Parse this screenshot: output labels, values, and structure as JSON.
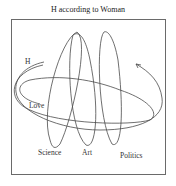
{
  "diagram": {
    "title": "H according to Woman",
    "labels": {
      "h": "H",
      "love": "Love",
      "science": "Science",
      "art": "Art",
      "politics": "Politics"
    },
    "colors": {
      "stroke": "#4a4a4a",
      "frame": "#6a6a6a",
      "text": "#333333"
    }
  }
}
